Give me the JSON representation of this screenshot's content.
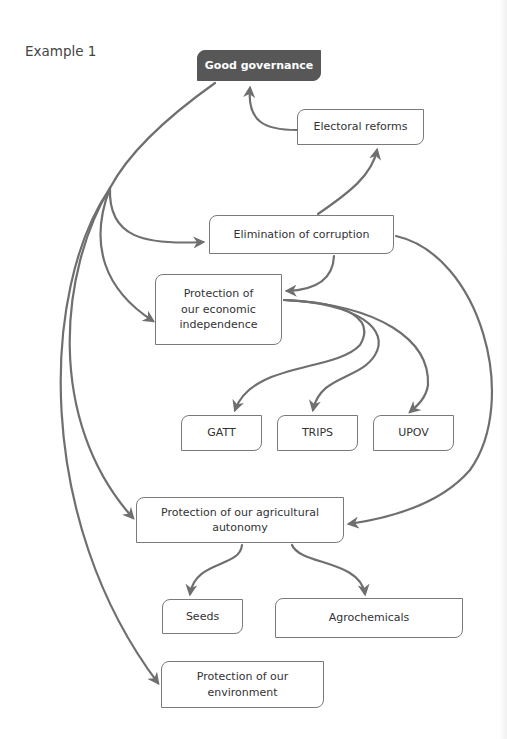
{
  "title": "Example 1",
  "colors": {
    "root_fill": "#575757",
    "root_text": "#ffffff",
    "node_border": "#7a7a7a",
    "edge": "#6f6f6f"
  },
  "nodes": {
    "good_governance": "Good governance",
    "electoral_reforms": "Electoral reforms",
    "elimination_of_corruption": "Elimination of corruption",
    "economic_independence": "Protection of our economic independence",
    "gatt": "GATT",
    "trips": "TRIPS",
    "upov": "UPOV",
    "agricultural_autonomy": "Protection of our agricultural autonomy",
    "seeds": "Seeds",
    "agrochemicals": "Agrochemicals",
    "environment": "Protection of our environment"
  },
  "edges": [
    {
      "from": "Electoral reforms",
      "to": "Good governance"
    },
    {
      "from": "Elimination of corruption",
      "to": "Electoral reforms"
    },
    {
      "from": "Good governance",
      "to": "Elimination of corruption"
    },
    {
      "from": "Good governance",
      "to": "Protection of our economic independence"
    },
    {
      "from": "Good governance",
      "to": "Protection of our agricultural autonomy"
    },
    {
      "from": "Good governance",
      "to": "Protection of our environment"
    },
    {
      "from": "Elimination of corruption",
      "to": "Protection of our economic independence"
    },
    {
      "from": "Elimination of corruption",
      "to": "Protection of our agricultural autonomy"
    },
    {
      "from": "Protection of our economic independence",
      "to": "GATT"
    },
    {
      "from": "Protection of our economic independence",
      "to": "TRIPS"
    },
    {
      "from": "Protection of our economic independence",
      "to": "UPOV"
    },
    {
      "from": "Protection of our agricultural autonomy",
      "to": "Seeds"
    },
    {
      "from": "Protection of our agricultural autonomy",
      "to": "Agrochemicals"
    }
  ]
}
